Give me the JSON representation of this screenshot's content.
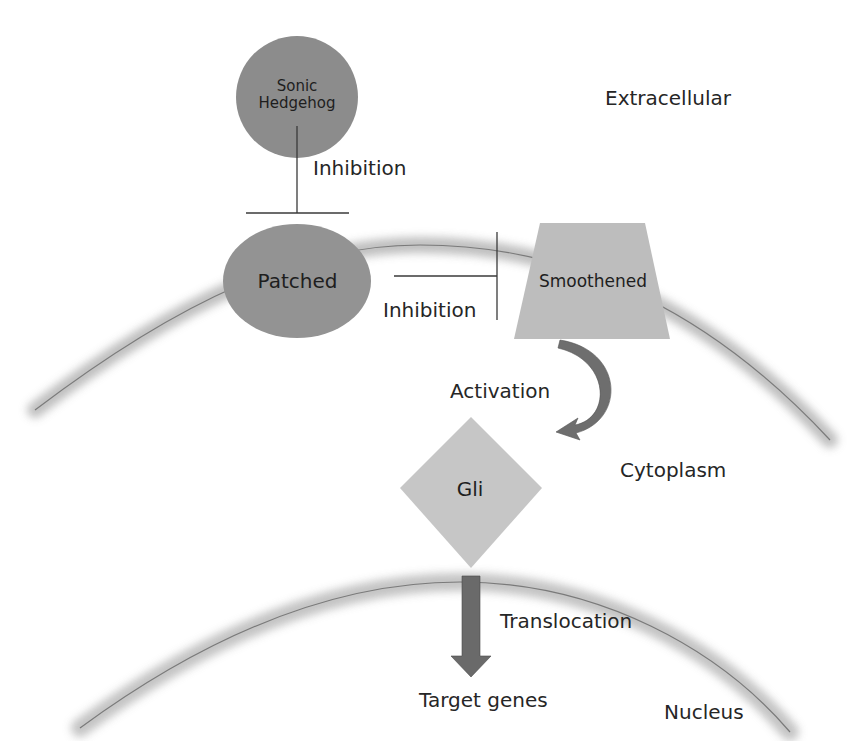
{
  "diagram": {
    "regions": {
      "extracellular": "Extracellular",
      "cytoplasm": "Cytoplasm",
      "nucleus": "Nucleus"
    },
    "nodes": {
      "shh": {
        "line1": "Sonic",
        "line2": "Hedgehog",
        "shape": "circle",
        "color": "#8c8c8c"
      },
      "patched": {
        "label": "Patched",
        "shape": "ellipse",
        "color": "#939393"
      },
      "smoothened": {
        "label": "Smoothened",
        "shape": "trapezoid",
        "color": "#bdbdbd"
      },
      "gli": {
        "label": "Gli",
        "shape": "diamond",
        "color": "#c6c6c6"
      },
      "target_genes": {
        "label": "Target genes"
      }
    },
    "edges": {
      "shh_patched": {
        "label": "Inhibition",
        "type": "inhibition"
      },
      "patched_smoothened": {
        "label": "Inhibition",
        "type": "inhibition"
      },
      "smoothened_gli": {
        "label": "Activation",
        "type": "curved-arrow",
        "color": "#6e6e6e"
      },
      "gli_targets": {
        "label": "Translocation",
        "type": "block-arrow",
        "color": "#6a6a6a"
      }
    },
    "membrane_color": "#b0b0b0",
    "membrane_line_color": "#7a7a7a"
  }
}
